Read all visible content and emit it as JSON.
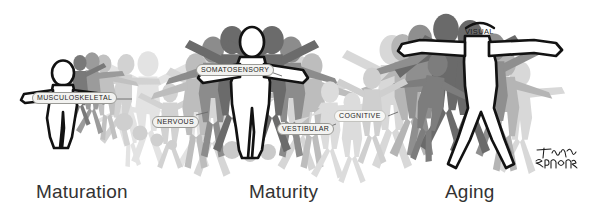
{
  "illustration": {
    "title": "Human postural control systems across the lifespan",
    "signature": "Timothy Brown",
    "background_color": "#ffffff",
    "outline_color": "#111111",
    "silhouette_dark": "#6e6e6e",
    "silhouette_mid": "#9b9b9b",
    "silhouette_light": "#c9c9c9",
    "silhouette_faint": "#e0e0e0",
    "body_fill": "#ffffff"
  },
  "stages": [
    {
      "id": "maturation",
      "caption": "Maturation"
    },
    {
      "id": "maturity",
      "caption": "Maturity"
    },
    {
      "id": "aging",
      "caption": "Aging"
    }
  ],
  "system_labels": [
    {
      "id": "musculoskeletal",
      "text": "MUSCULOSKELETAL",
      "stage": "maturation"
    },
    {
      "id": "nervous",
      "text": "NERVOUS",
      "stage": "maturation"
    },
    {
      "id": "somatosensory",
      "text": "SOMATOSENSORY",
      "stage": "maturity"
    },
    {
      "id": "vestibular",
      "text": "VESTIBULAR",
      "stage": "maturity"
    },
    {
      "id": "cognitive",
      "text": "COGNITIVE",
      "stage": "aging"
    },
    {
      "id": "visual",
      "text": "VISUAL",
      "stage": "aging"
    }
  ]
}
